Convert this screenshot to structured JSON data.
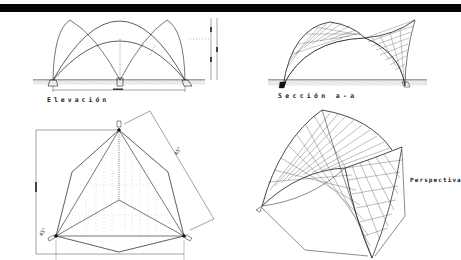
{
  "sheet": {
    "title_bar_color": "#050505",
    "background": "#ffffff",
    "line_color": "#1a1a1a"
  },
  "views": {
    "elevation": {
      "label": "Elevación"
    },
    "section": {
      "label": "Sección a-a"
    },
    "plan": {
      "angle_labels": [
        "45°",
        "45°"
      ]
    },
    "perspective": {
      "label": "Perspectiva"
    }
  }
}
